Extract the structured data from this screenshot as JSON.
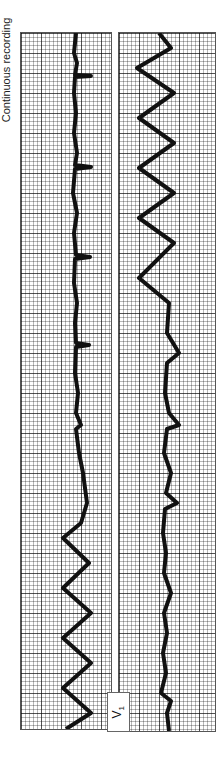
{
  "caption": "Continuous recording",
  "lead_label": {
    "letter": "V",
    "subscript": "1"
  },
  "strips": [
    {
      "id": "strip-1",
      "description": "Sinus rhythm with narrow complexes transitioning into wide sinusoidal ventricular tachycardia"
    },
    {
      "id": "strip-2",
      "description": "Wide sinusoidal tachycardia transitioning back to narrow complex rhythm"
    }
  ],
  "colors": {
    "trace": "#111111",
    "grid": "#555555",
    "paper": "#ffffff"
  }
}
